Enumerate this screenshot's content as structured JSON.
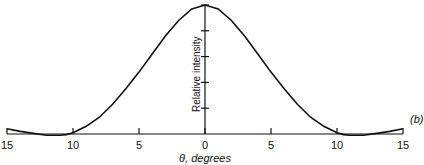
{
  "chart_data": {
    "type": "line",
    "title": "",
    "panel_label": "(b)",
    "xlabel": "θ, degrees",
    "ylabel": "Relative intensity",
    "xlim": [
      -15,
      15
    ],
    "ylim": [
      0,
      1
    ],
    "x_tick_labels": [
      "15",
      "10",
      "5",
      "0",
      "5",
      "10",
      "15"
    ],
    "x_ticks": [
      -15,
      -10,
      -5,
      0,
      5,
      10,
      15
    ],
    "y_ticks": [
      0.2,
      0.4,
      0.6,
      0.8,
      1.0
    ],
    "grid": false,
    "series": [
      {
        "name": "intensity",
        "x": [
          -15,
          -14,
          -13,
          -12,
          -11,
          -10.5,
          -10,
          -9,
          -8,
          -7,
          -6,
          -5,
          -4,
          -3,
          -2,
          -1,
          0,
          1,
          2,
          3,
          4,
          5,
          6,
          7,
          8,
          9,
          10,
          10.5,
          11,
          12,
          13,
          14,
          15
        ],
        "y": [
          0.04,
          0.02,
          0.005,
          -0.01,
          -0.01,
          -0.005,
          0.01,
          0.06,
          0.13,
          0.23,
          0.35,
          0.48,
          0.62,
          0.76,
          0.88,
          0.97,
          1.0,
          0.97,
          0.88,
          0.76,
          0.62,
          0.48,
          0.35,
          0.23,
          0.13,
          0.06,
          0.01,
          -0.005,
          -0.01,
          -0.01,
          0.005,
          0.02,
          0.04
        ]
      }
    ]
  }
}
